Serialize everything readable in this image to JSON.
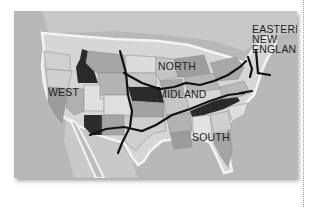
{
  "map": {
    "title": "American English dialect regions",
    "regions": [
      {
        "id": "west",
        "label": "WEST"
      },
      {
        "id": "north",
        "label": "NORTH"
      },
      {
        "id": "midland",
        "label": "MIDLAND"
      },
      {
        "id": "south",
        "label": "SOUTH"
      },
      {
        "id": "eastern-new-england",
        "label_lines": [
          "EASTERN",
          "NEW",
          "ENGLAND"
        ]
      }
    ],
    "colors": {
      "ocean": "#b9b9b9",
      "land_light": "#d9d9d9",
      "land_mid": "#a8a8a8",
      "land_dark": "#2a2a2a",
      "boundary": "#111111",
      "coast_glow": "#f2f2f2"
    }
  }
}
